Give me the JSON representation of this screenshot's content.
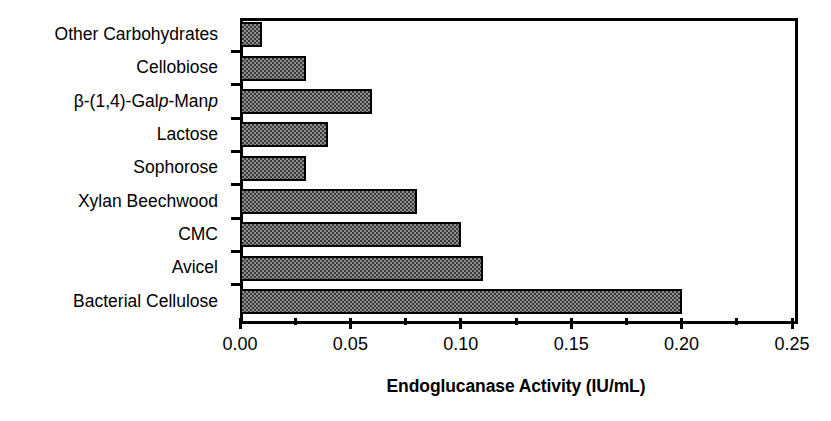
{
  "chart_data": {
    "type": "bar",
    "orientation": "horizontal",
    "title": "",
    "xlabel": "Endoglucanase Activity (IU/mL)",
    "ylabel": "",
    "xlim": [
      0.0,
      0.25
    ],
    "grid": false,
    "legend": null,
    "xticks": [
      "0.00",
      "0.05",
      "0.10",
      "0.15",
      "0.20",
      "0.25"
    ],
    "xtick_values": [
      0.0,
      0.05,
      0.1,
      0.15,
      0.2,
      0.25
    ],
    "xminor_tick_values": [
      0.025,
      0.075,
      0.125,
      0.175,
      0.225
    ],
    "categories": [
      "Other Carbohydrates",
      "Cellobiose",
      "β-(1,4)-Galp-Manp",
      "Lactose",
      "Sophorose",
      "Xylan Beechwood",
      "CMC",
      "Avicel",
      "Bacterial Cellulose"
    ],
    "category_labels_html": [
      "Other Carbohydrates",
      "Cellobiose",
      "β-(1,4)-Gal<i>p</i>-Man<i>p</i>",
      "Lactose",
      "Sophorose",
      "Xylan Beechwood",
      "CMC",
      "Avicel",
      "Bacterial Cellulose"
    ],
    "values": [
      0.01,
      0.03,
      0.06,
      0.04,
      0.03,
      0.08,
      0.1,
      0.11,
      0.2
    ],
    "bar_color": "#8e8e8e",
    "bar_pattern": "checkerboard-hatch",
    "bar_edge_color": "#000000",
    "axis_color": "#000000"
  }
}
